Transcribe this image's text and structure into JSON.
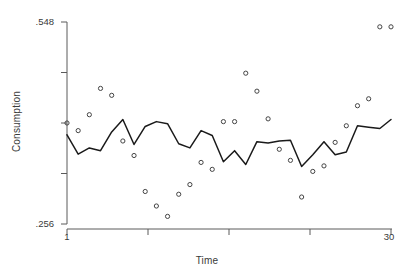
{
  "chart_data": {
    "type": "scatter",
    "title": "",
    "subtitle": "",
    "xlabel": "Time",
    "ylabel": "Consumption",
    "xlim": [
      1,
      30
    ],
    "ylim": [
      0.256,
      0.548
    ],
    "grid": false,
    "legend": null,
    "axis": {
      "y_ticks_labeled": [
        0.548,
        0.256
      ],
      "y_tick_labels": [
        ".548",
        ".256"
      ],
      "y_minor_tick_count": 5,
      "x_ticks_labeled": [
        1,
        30
      ],
      "x_tick_labels": [
        "1",
        "30"
      ],
      "x_minor_tick_positions": [
        1,
        8.2,
        15.6,
        22.9,
        30
      ]
    },
    "series": [
      {
        "name": "Consumption (observed)",
        "marker": "open-circle",
        "color": "#444444",
        "x": [
          1,
          2,
          3,
          4,
          5,
          6,
          7,
          8,
          9,
          10,
          11,
          12,
          13,
          14,
          15,
          16,
          17,
          18,
          19,
          20,
          21,
          22,
          23,
          24,
          25,
          26,
          27,
          28,
          29,
          30
        ],
        "values": [
          0.402,
          0.391,
          0.414,
          0.452,
          0.442,
          0.376,
          0.355,
          0.303,
          0.282,
          0.267,
          0.299,
          0.313,
          0.345,
          0.335,
          0.404,
          0.404,
          0.474,
          0.448,
          0.408,
          0.364,
          0.348,
          0.295,
          0.332,
          0.34,
          0.374,
          0.398,
          0.427,
          0.437,
          0.541,
          0.541
        ]
      },
      {
        "name": "Consumption (fitted)",
        "marker": "none",
        "color": "#1a1a1a",
        "x": [
          1,
          2,
          3,
          4,
          5,
          6,
          7,
          8,
          9,
          10,
          11,
          12,
          13,
          14,
          15,
          16,
          17,
          18,
          19,
          20,
          21,
          22,
          23,
          24,
          25,
          26,
          27,
          28,
          29,
          30
        ],
        "values": [
          0.385,
          0.357,
          0.366,
          0.362,
          0.389,
          0.407,
          0.371,
          0.397,
          0.404,
          0.401,
          0.372,
          0.366,
          0.391,
          0.384,
          0.346,
          0.362,
          0.342,
          0.375,
          0.373,
          0.376,
          0.377,
          0.339,
          0.356,
          0.375,
          0.356,
          0.36,
          0.398,
          0.396,
          0.394,
          0.407
        ]
      }
    ]
  }
}
